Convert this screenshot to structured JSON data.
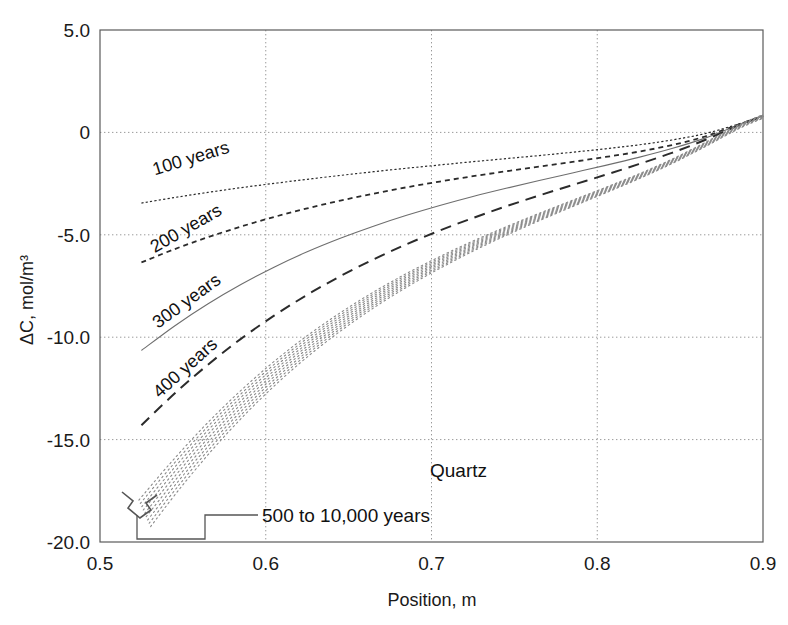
{
  "figure": {
    "name": "quartz-concentration-profile",
    "background_color": "#ffffff",
    "frame_color": "#5a5a5a",
    "grid_color": "#9a9a9a"
  },
  "chart_data": {
    "type": "line",
    "title": "",
    "subtitle": "",
    "xlabel": "Position, m",
    "ylabel": "ΔC, mol/m³",
    "xlim": [
      0.5,
      0.9
    ],
    "ylim": [
      -20.0,
      5.0
    ],
    "grid": true,
    "legend_position": "inline-annotations",
    "xticks": [
      0.5,
      0.6,
      0.7,
      0.8,
      0.9
    ],
    "xtick_labels": [
      "0.5",
      "0.6",
      "0.7",
      "0.8",
      "0.9"
    ],
    "yticks": [
      5.0,
      0,
      -5.0,
      -10.0,
      -15.0,
      -20.0
    ],
    "ytick_labels": [
      "5.0",
      "0",
      "-5.0",
      "-10.0",
      "-15.0",
      "-20.0"
    ],
    "annotations": [
      {
        "text": "Quartz",
        "x": 0.728,
        "y": -17.1
      },
      {
        "text": "500 to 10,000 years",
        "x": 0.605,
        "y": -18.9
      }
    ],
    "series": [
      {
        "name": "100 years",
        "label": "100 years",
        "style": "fine-dotted",
        "color": "#2b2b2b",
        "label_x": 0.533,
        "label_y": -2.1,
        "label_rotation": -17,
        "x": [
          0.525,
          0.545,
          0.565,
          0.585,
          0.605,
          0.625,
          0.645,
          0.665,
          0.685,
          0.705,
          0.725,
          0.745,
          0.765,
          0.785,
          0.805,
          0.825,
          0.845,
          0.865,
          0.885,
          0.9
        ],
        "y": [
          -3.45,
          -3.18,
          -2.93,
          -2.7,
          -2.49,
          -2.29,
          -2.1,
          -1.92,
          -1.75,
          -1.59,
          -1.43,
          -1.28,
          -1.13,
          -0.97,
          -0.8,
          -0.61,
          -0.37,
          -0.06,
          0.4,
          0.8
        ]
      },
      {
        "name": "200 years",
        "label": "200 years",
        "style": "short-dash",
        "color": "#2b2b2b",
        "label_x": 0.533,
        "label_y": -5.9,
        "label_rotation": -30,
        "x": [
          0.525,
          0.545,
          0.565,
          0.585,
          0.605,
          0.625,
          0.645,
          0.665,
          0.685,
          0.705,
          0.725,
          0.745,
          0.765,
          0.785,
          0.805,
          0.825,
          0.845,
          0.865,
          0.885,
          0.9
        ],
        "y": [
          -6.35,
          -5.7,
          -5.12,
          -4.6,
          -4.13,
          -3.71,
          -3.33,
          -2.99,
          -2.68,
          -2.4,
          -2.14,
          -1.9,
          -1.67,
          -1.44,
          -1.2,
          -0.94,
          -0.62,
          -0.2,
          0.38,
          0.82
        ]
      },
      {
        "name": "300 years",
        "label": "300 years",
        "style": "solid-thin",
        "color": "#6e6e6e",
        "label_x": 0.535,
        "label_y": -9.6,
        "label_rotation": -36,
        "x": [
          0.525,
          0.545,
          0.565,
          0.585,
          0.605,
          0.625,
          0.645,
          0.665,
          0.685,
          0.705,
          0.725,
          0.745,
          0.765,
          0.785,
          0.805,
          0.825,
          0.845,
          0.865,
          0.885,
          0.9
        ],
        "y": [
          -10.65,
          -9.45,
          -8.38,
          -7.43,
          -6.58,
          -5.83,
          -5.17,
          -4.58,
          -4.05,
          -3.57,
          -3.13,
          -2.73,
          -2.35,
          -1.98,
          -1.61,
          -1.22,
          -0.79,
          -0.28,
          0.36,
          0.82
        ]
      },
      {
        "name": "400 years",
        "label": "400 years",
        "style": "long-dash",
        "color": "#2b2b2b",
        "label_x": 0.536,
        "label_y": -13.0,
        "label_rotation": -42,
        "x": [
          0.525,
          0.545,
          0.565,
          0.585,
          0.605,
          0.625,
          0.645,
          0.665,
          0.685,
          0.705,
          0.725,
          0.745,
          0.765,
          0.785,
          0.805,
          0.825,
          0.845,
          0.865,
          0.885,
          0.9
        ],
        "y": [
          -14.3,
          -12.75,
          -11.35,
          -10.08,
          -8.95,
          -7.93,
          -7.02,
          -6.2,
          -5.46,
          -4.79,
          -4.18,
          -3.61,
          -3.08,
          -2.57,
          -2.07,
          -1.55,
          -1.0,
          -0.37,
          0.33,
          0.8
        ]
      },
      {
        "name": "500 to 10,000 years",
        "label": "500 to 10,000 years",
        "style": "dotted-bundle",
        "color": "#8a8a8a",
        "bundle_count": 9,
        "x": [
          0.527,
          0.545,
          0.565,
          0.585,
          0.605,
          0.625,
          0.645,
          0.665,
          0.685,
          0.705,
          0.725,
          0.745,
          0.765,
          0.785,
          0.805,
          0.825,
          0.845,
          0.865,
          0.885,
          0.9
        ],
        "y": [
          -18.6,
          -16.8,
          -14.95,
          -13.28,
          -11.78,
          -10.44,
          -9.25,
          -8.18,
          -7.22,
          -6.35,
          -5.55,
          -4.82,
          -4.13,
          -3.47,
          -2.82,
          -2.15,
          -1.42,
          -0.6,
          0.26,
          0.78
        ]
      }
    ]
  }
}
